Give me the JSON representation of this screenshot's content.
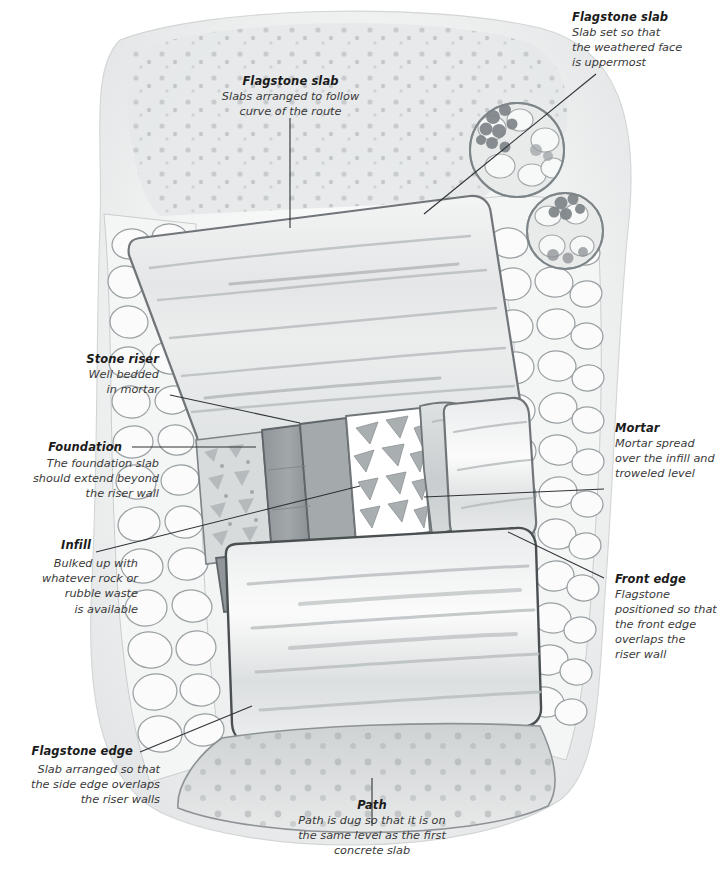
{
  "illustration": {
    "subject": "Garden flagstone step construction cutaway",
    "style": "watercolour-and-ink technical illustration",
    "colors": {
      "paper": "#ffffff",
      "wash_light": "#e8e9ea",
      "wash_mid": "#cfd2d3",
      "wash_dark": "#9fa4a6",
      "riser_dark": "#8d9396",
      "ink": "#3b3f42",
      "leader": "#2f3336",
      "foliage": "#6d7376"
    }
  },
  "labels": [
    {
      "id": "flagstone-slab-top",
      "heading": "Flagstone slab",
      "body": [
        "Slabs arranged to follow",
        "curve of the route"
      ],
      "align": "center"
    },
    {
      "id": "flagstone-slab-right",
      "heading": "Flagstone slab",
      "body": [
        "Slab set so that",
        "the weathered face",
        "is uppermost"
      ],
      "align": "left"
    },
    {
      "id": "stone-riser",
      "heading": "Stone riser",
      "body": [
        "Well bedded",
        "in mortar"
      ],
      "align": "right"
    },
    {
      "id": "foundation",
      "heading": "Foundation",
      "body": [
        "The foundation slab",
        "should extend beyond",
        "the riser wall"
      ],
      "align": "right"
    },
    {
      "id": "infill",
      "heading": "Infill",
      "body": [
        "Bulked up with",
        "whatever rock or",
        "rubble waste",
        "is available"
      ],
      "align": "right"
    },
    {
      "id": "flagstone-edge",
      "heading": "Flagstone edge",
      "body": [
        "Slab arranged so that",
        "the side edge overlaps",
        "the riser walls"
      ],
      "align": "right"
    },
    {
      "id": "mortar",
      "heading": "Mortar",
      "body": [
        "Mortar spread",
        "over the infill and",
        "troweled level"
      ],
      "align": "left"
    },
    {
      "id": "front-edge",
      "heading": "Front edge",
      "body": [
        "Flagstone",
        "positioned so that",
        "the front edge",
        "overlaps the",
        "riser wall"
      ],
      "align": "left"
    },
    {
      "id": "path",
      "heading": "Path",
      "body": [
        "Path is dug so that it is on",
        "the same level as the first",
        "concrete slab"
      ],
      "align": "center"
    }
  ]
}
